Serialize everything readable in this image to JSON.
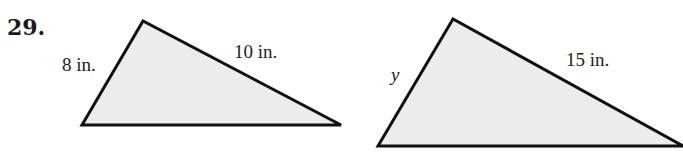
{
  "problem": {
    "number": "29."
  },
  "figures": [
    {
      "name": "triangle-1",
      "vertices": [
        [
          143,
          21
        ],
        [
          82,
          125
        ],
        [
          341,
          125
        ]
      ],
      "labels": {
        "left_side": "8 in.",
        "right_side": "10 in."
      }
    },
    {
      "name": "triangle-2",
      "vertices": [
        [
          453,
          19
        ],
        [
          378,
          146
        ],
        [
          683,
          146
        ]
      ],
      "labels": {
        "left_side": "y",
        "right_side": "15 in."
      }
    }
  ],
  "colors": {
    "fill": "#ececec",
    "stroke": "#111111",
    "text": "#222222"
  }
}
